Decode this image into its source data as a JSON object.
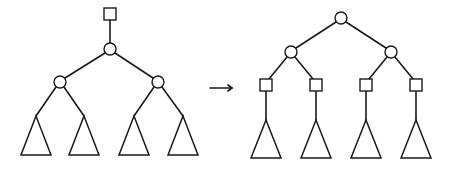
{
  "diagram": {
    "colors": {
      "stroke": "#1a1a1a",
      "fill": "#ffffff",
      "background": "#ffffff"
    },
    "left_tree": {
      "square_nodes": [
        {
          "x": 110,
          "y": 14
        }
      ],
      "circle_nodes": [
        {
          "x": 110,
          "y": 49
        },
        {
          "x": 60,
          "y": 82
        },
        {
          "x": 158,
          "y": 82
        }
      ],
      "edges": [
        [
          110,
          20,
          110,
          43
        ],
        [
          105,
          53,
          65,
          78
        ],
        [
          115,
          53,
          153,
          78
        ],
        [
          56,
          87,
          36,
          116
        ],
        [
          64,
          87,
          84,
          116
        ],
        [
          154,
          87,
          134,
          116
        ],
        [
          162,
          87,
          183,
          116
        ]
      ],
      "subtrees": [
        {
          "apex_x": 36,
          "apex_y": 116,
          "base_y": 155,
          "half_width": 15
        },
        {
          "apex_x": 84,
          "apex_y": 116,
          "base_y": 155,
          "half_width": 15
        },
        {
          "apex_x": 134,
          "apex_y": 116,
          "base_y": 155,
          "half_width": 15
        },
        {
          "apex_x": 183,
          "apex_y": 116,
          "base_y": 155,
          "half_width": 15
        }
      ]
    },
    "arrow": {
      "symbol": "→",
      "x1": 210,
      "y1": 88,
      "x2": 232,
      "y2": 88
    },
    "right_tree": {
      "circle_nodes": [
        {
          "x": 341,
          "y": 18
        },
        {
          "x": 291,
          "y": 52
        },
        {
          "x": 391,
          "y": 52
        }
      ],
      "square_nodes": [
        {
          "x": 266,
          "y": 85
        },
        {
          "x": 316,
          "y": 85
        },
        {
          "x": 366,
          "y": 85
        },
        {
          "x": 416,
          "y": 85
        }
      ],
      "edges": [
        [
          336,
          22,
          296,
          48
        ],
        [
          346,
          22,
          386,
          48
        ],
        [
          287,
          57,
          269,
          79
        ],
        [
          295,
          57,
          313,
          79
        ],
        [
          387,
          57,
          369,
          79
        ],
        [
          395,
          57,
          413,
          79
        ],
        [
          266,
          91,
          266,
          120
        ],
        [
          316,
          91,
          316,
          120
        ],
        [
          366,
          91,
          366,
          120
        ],
        [
          416,
          91,
          416,
          120
        ]
      ],
      "subtrees": [
        {
          "apex_x": 266,
          "apex_y": 120,
          "base_y": 158,
          "half_width": 15
        },
        {
          "apex_x": 316,
          "apex_y": 120,
          "base_y": 158,
          "half_width": 15
        },
        {
          "apex_x": 366,
          "apex_y": 120,
          "base_y": 158,
          "half_width": 15
        },
        {
          "apex_x": 416,
          "apex_y": 120,
          "base_y": 158,
          "half_width": 15
        }
      ]
    },
    "node_sizes": {
      "circle_radius": 6,
      "square_size": 12
    }
  }
}
